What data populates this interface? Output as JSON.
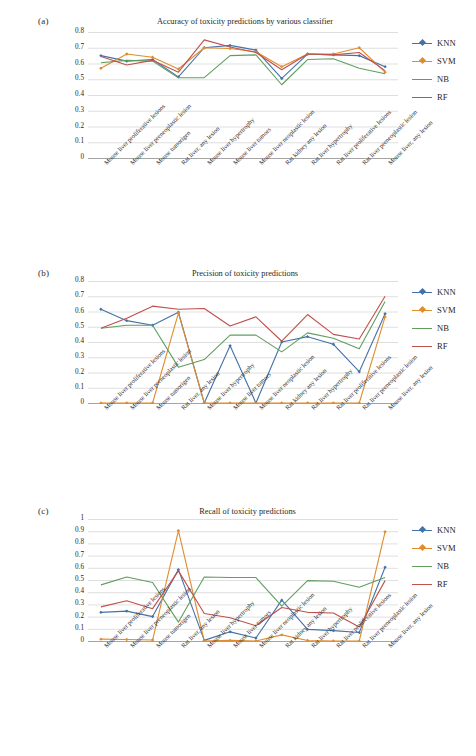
{
  "figure": {
    "background": "#ffffff",
    "series_colors": {
      "KNN": "#4472a8",
      "SVM": "#e08c2e",
      "NB": "#5f9e5f",
      "RF": "#c0504d"
    }
  },
  "panels": [
    {
      "tag": "(a)",
      "title": "Accuracy of toxicity predictions by various classifier"
    },
    {
      "tag": "(b)",
      "title": "Precision of toxicity predictions"
    },
    {
      "tag": "(c)",
      "title": "Recall of toxicity predictions"
    }
  ],
  "legend": {
    "position": "right",
    "entries": [
      {
        "label": "KNN",
        "color": "#4472a8",
        "marker": "diamond"
      },
      {
        "label": "SVM",
        "color": "#e08c2e",
        "marker": "diamond"
      },
      {
        "label": "NB",
        "color": "#5f9e5f",
        "marker": "none"
      },
      {
        "label": "RF",
        "color": "#c0504d",
        "marker": "none"
      }
    ]
  },
  "categories": [
    "Mouse liver proliferative lesions",
    "Mouse liver preneoplastic lesion",
    "Mouse tumorigen",
    "Rat liver, any lesion",
    "Mouse liver hypertrophy",
    "Mouse liver tumors",
    "Mouse liver neoplastic lesion",
    "Rat kidney any lesion",
    "Rat liver hypertrophy",
    "Rat liver proliferative lesions",
    "Rat liver preneoplastic lesion",
    "Mouse liver, any lesion"
  ],
  "chart_data": [
    {
      "type": "line",
      "panel": "(a)",
      "title": "Accuracy of toxicity predictions by various classifier",
      "xlabel": "",
      "ylabel": "",
      "ylim": [
        0,
        0.8
      ],
      "yticks": [
        0,
        0.1,
        0.2,
        0.3,
        0.4,
        0.5,
        0.6,
        0.7,
        0.8
      ],
      "ytick_labels": [
        "0",
        "0.1",
        "0.2",
        "0.3",
        "0.4",
        "0.5",
        "0.6",
        "0.7",
        "0.8"
      ],
      "grid": "horizontal",
      "legend_position": "right",
      "categories": [
        "Mouse liver proliferative lesions",
        "Mouse liver preneoplastic lesion",
        "Mouse tumorigen",
        "Rat liver, any lesion",
        "Mouse liver hypertrophy",
        "Mouse liver tumors",
        "Mouse liver neoplastic lesion",
        "Rat kidney any lesion",
        "Rat liver hypertrophy",
        "Rat liver proliferative lesions",
        "Rat liver preneoplastic lesion",
        "Mouse liver, any lesion"
      ],
      "series": [
        {
          "name": "KNN",
          "color": "#4472a8",
          "values": [
            0.65,
            0.615,
            0.625,
            0.515,
            0.7,
            0.715,
            0.685,
            0.505,
            0.66,
            0.655,
            0.65,
            0.58
          ]
        },
        {
          "name": "SVM",
          "color": "#e08c2e",
          "values": [
            0.57,
            0.66,
            0.64,
            0.565,
            0.7,
            0.695,
            0.675,
            0.58,
            0.66,
            0.66,
            0.7,
            0.545
          ]
        },
        {
          "name": "NB",
          "color": "#5f9e5f",
          "values": [
            0.605,
            0.62,
            0.615,
            0.51,
            0.51,
            0.65,
            0.655,
            0.465,
            0.625,
            0.63,
            0.57,
            0.535
          ]
        },
        {
          "name": "RF",
          "color": "#c0504d",
          "values": [
            0.645,
            0.59,
            0.62,
            0.545,
            0.75,
            0.705,
            0.67,
            0.56,
            0.66,
            0.655,
            0.67,
            0.555
          ]
        }
      ]
    },
    {
      "type": "line",
      "panel": "(b)",
      "title": "Precision of toxicity predictions",
      "xlabel": "",
      "ylabel": "",
      "ylim": [
        0,
        0.8
      ],
      "yticks": [
        0,
        0.1,
        0.2,
        0.3,
        0.4,
        0.5,
        0.6,
        0.7,
        0.8
      ],
      "ytick_labels": [
        "0",
        "0.1",
        "0.2",
        "0.3",
        "0.4",
        "0.5",
        "0.6",
        "0.7",
        "0.8"
      ],
      "grid": "horizontal",
      "legend_position": "right",
      "categories": [
        "Mouse liver proliferative lesions",
        "Mouse liver preneoplastic lesion",
        "Mouse tumorigen",
        "Rat liver, any lesion",
        "Mouse liver hypertrophy",
        "Mouse liver tumors",
        "Mouse liver neoplastic lesion",
        "Rat kidney any lesion",
        "Rat liver hypertrophy",
        "Rat liver proliferative lesions",
        "Rat liver preneoplastic lesion",
        "Mouse liver, any lesion"
      ],
      "series": [
        {
          "name": "KNN",
          "color": "#4472a8",
          "values": [
            0.615,
            0.54,
            0.51,
            0.595,
            0.0,
            0.375,
            0.0,
            0.4,
            0.435,
            0.385,
            0.205,
            0.585
          ]
        },
        {
          "name": "SVM",
          "color": "#e08c2e",
          "values": [
            0.0,
            0.0,
            0.0,
            0.59,
            0.0,
            0.0,
            0.0,
            0.0,
            0.0,
            0.0,
            0.0,
            0.565
          ]
        },
        {
          "name": "NB",
          "color": "#5f9e5f",
          "values": [
            0.49,
            0.51,
            0.51,
            0.235,
            0.285,
            0.445,
            0.445,
            0.335,
            0.46,
            0.425,
            0.355,
            0.665
          ]
        },
        {
          "name": "RF",
          "color": "#c0504d",
          "values": [
            0.49,
            0.555,
            0.635,
            0.615,
            0.62,
            0.505,
            0.565,
            0.405,
            0.58,
            0.45,
            0.42,
            0.7
          ]
        }
      ]
    },
    {
      "type": "line",
      "panel": "(c)",
      "title": "Recall of toxicity predictions",
      "xlabel": "",
      "ylabel": "",
      "ylim": [
        0,
        1
      ],
      "yticks": [
        0,
        0.1,
        0.2,
        0.3,
        0.4,
        0.5,
        0.6,
        0.7,
        0.8,
        0.9,
        1
      ],
      "ytick_labels": [
        "0",
        "0.1",
        "0.2",
        "0.3",
        "0.4",
        "0.5",
        "0.6",
        "0.7",
        "0.8",
        "0.9",
        "1"
      ],
      "grid": "horizontal",
      "legend_position": "right",
      "categories": [
        "Mouse liver proliferative lesions",
        "Mouse liver preneoplastic lesion",
        "Mouse tumorigen",
        "Rat liver, any lesion",
        "Mouse liver hypertrophy",
        "Mouse liver tumors",
        "Mouse liver neoplastic lesion",
        "Rat kidney any lesion",
        "Rat liver hypertrophy",
        "Rat liver proliferative lesions",
        "Rat liver preneoplastic lesion",
        "Mouse liver, any lesion"
      ],
      "series": [
        {
          "name": "KNN",
          "color": "#4472a8",
          "values": [
            0.235,
            0.245,
            0.2,
            0.585,
            0.005,
            0.075,
            0.025,
            0.335,
            0.095,
            0.085,
            0.07,
            0.605
          ]
        },
        {
          "name": "SVM",
          "color": "#e08c2e",
          "values": [
            0.015,
            0.012,
            0.008,
            0.905,
            0.0,
            0.005,
            0.0,
            0.05,
            0.004,
            0.0,
            0.0,
            0.895
          ]
        },
        {
          "name": "NB",
          "color": "#5f9e5f",
          "values": [
            0.46,
            0.525,
            0.48,
            0.155,
            0.525,
            0.52,
            0.52,
            0.285,
            0.495,
            0.49,
            0.44,
            0.52
          ]
        },
        {
          "name": "RF",
          "color": "#c0504d",
          "values": [
            0.28,
            0.33,
            0.265,
            0.575,
            0.225,
            0.19,
            0.125,
            0.275,
            0.235,
            0.23,
            0.115,
            0.495
          ]
        }
      ]
    }
  ]
}
